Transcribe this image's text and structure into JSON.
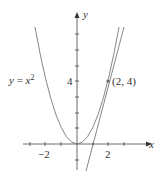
{
  "diagram": {
    "curve_label": "y = x²",
    "curve_label_parts": {
      "lhs": "y",
      "eq": " = ",
      "var": "x",
      "exp": "2"
    },
    "x_axis_label": "x",
    "y_axis_label": "y",
    "x_tick_labels": [
      "−2",
      "2"
    ],
    "y_tick_labels": [
      "4"
    ],
    "point_label": "(2, 4)",
    "point": {
      "x": 2,
      "y": 4
    },
    "tangent_line": "y = 4x − 4",
    "colors": {
      "curve": "#777777",
      "axes": "#444444",
      "text": "#333333"
    }
  }
}
